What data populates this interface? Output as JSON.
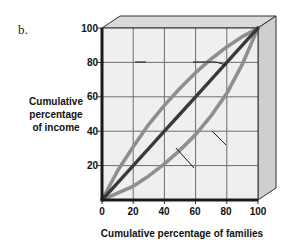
{
  "figure": {
    "panel_letter": "b.",
    "background_color": "#ffffff",
    "plot_background_color": "#efefef",
    "plot_face_3d_color": "#d5d5d5",
    "grid_color": "#6d6d6d",
    "axis_color": "#1a1a1a"
  },
  "annotations": {
    "perfect_equality": {
      "line1": "Perfect",
      "line2": "equality",
      "line3": "line"
    },
    "beta": "Beta",
    "alpha": "Alpha"
  },
  "axes": {
    "x": {
      "label": "Cumulative percentage of families",
      "ticks": [
        "0",
        "20",
        "40",
        "60",
        "80",
        "100"
      ],
      "min": 0,
      "max": 100
    },
    "y": {
      "label_line1": "Cumulative",
      "label_line2": "percentage",
      "label_line3": "of income",
      "ticks": [
        "20",
        "40",
        "60",
        "80",
        "100"
      ],
      "min": 0,
      "max": 100
    }
  },
  "chart_data": {
    "type": "line",
    "title": "",
    "subtitle": "",
    "xlabel": "Cumulative percentage of families",
    "ylabel": "Cumulative percentage of income",
    "xlim": [
      0,
      100
    ],
    "ylim": [
      0,
      100
    ],
    "xticks": [
      0,
      20,
      40,
      60,
      80,
      100
    ],
    "yticks": [
      0,
      20,
      40,
      60,
      80,
      100
    ],
    "grid": true,
    "legend": "none",
    "annotations": [
      "Perfect equality line",
      "Beta",
      "Alpha"
    ],
    "x": [
      0,
      10,
      20,
      30,
      40,
      50,
      60,
      70,
      80,
      90,
      100
    ],
    "series": [
      {
        "name": "Perfect equality line",
        "color": "#3a3a3a",
        "values": [
          0,
          10,
          20,
          30,
          40,
          50,
          60,
          70,
          80,
          90,
          100
        ]
      },
      {
        "name": "Beta",
        "color": "#8f8f8f",
        "values": [
          0,
          17,
          31,
          44,
          55,
          65,
          74,
          82,
          89,
          95,
          100
        ]
      },
      {
        "name": "Alpha",
        "color": "#8f8f8f",
        "values": [
          0,
          4,
          8,
          14,
          21,
          29,
          38,
          49,
          62,
          79,
          100
        ]
      }
    ]
  }
}
